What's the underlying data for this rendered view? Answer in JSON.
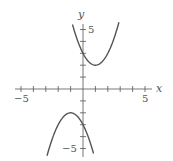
{
  "chart_data": {
    "type": "line",
    "title": "",
    "xlabel": "x",
    "ylabel": "y",
    "xlim": [
      -5.3,
      5.3
    ],
    "ylim": [
      -5.6,
      5.9
    ],
    "grid": false,
    "legend": null,
    "x_tick_labels": [
      {
        "value": -5,
        "label": "−5"
      },
      {
        "value": 5,
        "label": "5"
      }
    ],
    "y_tick_labels": [
      {
        "value": 5,
        "label": "5"
      },
      {
        "value": -5,
        "label": "−5"
      }
    ],
    "x_ticks": [
      -5,
      -4,
      -3,
      -2,
      -1,
      1,
      2,
      3,
      4,
      5
    ],
    "y_ticks": [
      -5,
      -4,
      -3,
      -2,
      -1,
      1,
      2,
      3,
      4,
      5
    ],
    "series": [
      {
        "name": "upper parabola",
        "formula": "y = x^2 - 2x + 3",
        "x": [
          -0.85,
          -0.5,
          0,
          0.5,
          1,
          1.5,
          2,
          2.5,
          2.9
        ],
        "y": [
          5.42,
          4.25,
          3.0,
          2.25,
          2.0,
          2.25,
          3.0,
          4.25,
          5.61
        ]
      },
      {
        "name": "lower parabola",
        "formula": "y = -x^2 - 2x - 3",
        "x": [
          -2.9,
          -2.5,
          -2,
          -1.5,
          -1,
          -0.5,
          0,
          0.5,
          0.85
        ],
        "y": [
          -5.61,
          -4.25,
          -3.0,
          -2.25,
          -2.0,
          -2.25,
          -3.0,
          -4.25,
          -5.42
        ]
      }
    ]
  },
  "labels": {
    "x_axis": "x",
    "y_axis": "y",
    "x_min": "−5",
    "x_max": "5",
    "y_max": "5",
    "y_min": "−5"
  },
  "colors": {
    "axis": "#555555",
    "curve": "#555555"
  }
}
